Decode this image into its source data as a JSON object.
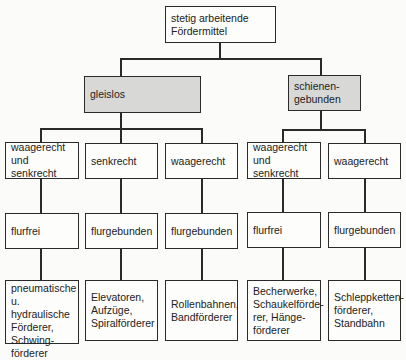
{
  "root": {
    "label": "stetig arbeitende\nFördermittel"
  },
  "categories": [
    {
      "label": "gleislos"
    },
    {
      "label": "schienen-\ngebunden"
    }
  ],
  "columns": [
    {
      "direction": "waagerecht\nund senkrecht",
      "floor": "flurfrei",
      "examples": "pneumatische\nu. hydraulische\nFörderer,\nSchwing-\nförderer"
    },
    {
      "direction": "senkrecht",
      "floor": "flurgebunden",
      "examples": "Elevatoren,\nAufzüge,\nSpiralförderer"
    },
    {
      "direction": "waagerecht",
      "floor": "flurgebunden",
      "examples": "Rollenbahnen,\nBandförderer"
    },
    {
      "direction": "waagerecht\nund senkrecht",
      "floor": "flurfrei",
      "examples": "Becherwerke,\nSchaukelförde-\nrer, Hänge-\nförderer"
    },
    {
      "direction": "waagerecht",
      "floor": "flurgebunden",
      "examples": "Schleppketten-\nförderer,\nStandbahn"
    }
  ],
  "colors": {
    "category_fill": "#d8d8d6",
    "line": "#2a2a2a",
    "box_fill": "#fdfdfc"
  }
}
